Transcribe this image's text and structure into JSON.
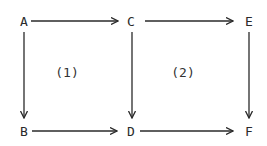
{
  "diagram": {
    "type": "commutative-diagram",
    "nodes": [
      {
        "id": "A",
        "label": "A",
        "x": 24,
        "y": 21
      },
      {
        "id": "C",
        "label": "C",
        "x": 131,
        "y": 21
      },
      {
        "id": "E",
        "label": "E",
        "x": 249,
        "y": 21
      },
      {
        "id": "B",
        "label": "B",
        "x": 24,
        "y": 131
      },
      {
        "id": "D",
        "label": "D",
        "x": 131,
        "y": 131
      },
      {
        "id": "F",
        "label": "F",
        "x": 249,
        "y": 131
      }
    ],
    "edges": [
      {
        "from": "A",
        "to": "C"
      },
      {
        "from": "C",
        "to": "E"
      },
      {
        "from": "A",
        "to": "B"
      },
      {
        "from": "C",
        "to": "D"
      },
      {
        "from": "E",
        "to": "F"
      },
      {
        "from": "B",
        "to": "D"
      },
      {
        "from": "D",
        "to": "F"
      }
    ],
    "regions": [
      {
        "label": "(1)",
        "x": 67,
        "y": 72
      },
      {
        "label": "(2)",
        "x": 183,
        "y": 72
      }
    ],
    "colors": {
      "stroke": "#2a2a2a",
      "background": "#ffffff"
    }
  }
}
